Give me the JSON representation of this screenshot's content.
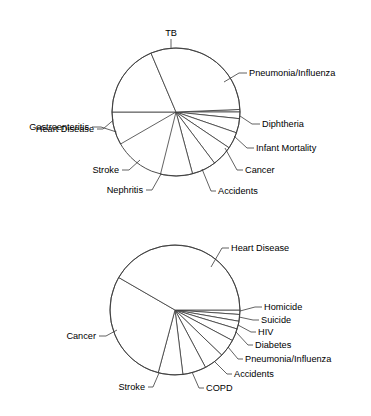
{
  "figure": {
    "background_color": "#ffffff",
    "line_color": "#3a3a3a",
    "text_color": "#000000"
  },
  "chart_data": [
    {
      "type": "pie",
      "name": "leading-causes-of-death-chart-top",
      "title": "",
      "center": [
        176,
        112
      ],
      "radius": 64,
      "start_angle_deg": 0,
      "direction": "counterclockwise",
      "grid": false,
      "legend": "none",
      "labels_position": "outside-with-leader-lines",
      "categories": [
        "Diphtheria",
        "Infant Mortality",
        "Cancer",
        "Accidents",
        "Nephritis",
        "Stroke",
        "Heart Disease",
        "Gastroenteritis",
        "TB",
        "Pneumonia/Influenza"
      ],
      "values": [
        2.3,
        4.2,
        3.7,
        4.2,
        5.2,
        6.2,
        8.0,
        8.2,
        11.3,
        11.8
      ],
      "unit": "percent of all deaths",
      "slices": [
        {
          "label": "Diphtheria",
          "start_deg": 0.0,
          "end_deg": 2.3,
          "value": 2.3
        },
        {
          "label": "Infant Mortality",
          "start_deg": 354.0,
          "end_deg": 360.0,
          "value": 4.2
        },
        {
          "label": "Cancer",
          "start_deg": 341.0,
          "end_deg": 354.0,
          "value": 3.7
        },
        {
          "label": "Accidents",
          "start_deg": 326.0,
          "end_deg": 341.0,
          "value": 4.2
        },
        {
          "label": "Nephritis",
          "start_deg": 307.0,
          "end_deg": 326.0,
          "value": 5.2
        },
        {
          "label": "Stroke",
          "start_deg": 285.0,
          "end_deg": 307.0,
          "value": 6.2
        },
        {
          "label": "Heart Disease",
          "start_deg": 256.0,
          "end_deg": 285.0,
          "value": 8.0
        },
        {
          "label": "Gastroenteritis",
          "start_deg": 180.0,
          "end_deg": 210.0,
          "value": 8.2
        },
        {
          "label": "TB",
          "start_deg": 113.0,
          "end_deg": 180.0,
          "value": 11.3
        },
        {
          "label": "Pneumonia/Influenza",
          "start_deg": 2.3,
          "end_deg": 113.0,
          "value": 11.8
        }
      ]
    },
    {
      "type": "pie",
      "name": "leading-causes-of-death-chart-bottom",
      "title": "",
      "center": [
        175,
        310
      ],
      "radius": 65,
      "start_angle_deg": 0,
      "direction": "counterclockwise",
      "grid": false,
      "legend": "none",
      "labels_position": "outside-with-leader-lines",
      "categories": [
        "Homicide",
        "Suicide",
        "HIV",
        "Diabetes",
        "Pneumonia/Influenza",
        "Accidents",
        "COPD",
        "Stroke",
        "Cancer",
        "Heart Disease"
      ],
      "values": [
        0.8,
        1.3,
        1.5,
        2.4,
        3.6,
        4.0,
        4.7,
        7.0,
        23.0,
        31.0
      ],
      "unit": "percent of all deaths",
      "slices": [
        {
          "label": "Homicide",
          "start_deg": 356.0,
          "end_deg": 360.0,
          "value": 0.8
        },
        {
          "label": "Suicide",
          "start_deg": 350.0,
          "end_deg": 356.0,
          "value": 1.3
        },
        {
          "label": "HIV",
          "start_deg": 343.0,
          "end_deg": 350.0,
          "value": 1.5
        },
        {
          "label": "Diabetes",
          "start_deg": 332.0,
          "end_deg": 343.0,
          "value": 2.4
        },
        {
          "label": "Pneumonia/Influenza",
          "start_deg": 316.0,
          "end_deg": 332.0,
          "value": 3.6
        },
        {
          "label": "Accidents",
          "start_deg": 298.0,
          "end_deg": 316.0,
          "value": 4.0
        },
        {
          "label": "COPD",
          "start_deg": 277.0,
          "end_deg": 298.0,
          "value": 4.7
        },
        {
          "label": "Stroke",
          "start_deg": 255.0,
          "end_deg": 277.0,
          "value": 7.0
        },
        {
          "label": "Cancer",
          "start_deg": 150.0,
          "end_deg": 255.0,
          "value": 23.0
        },
        {
          "label": "Heart Disease",
          "start_deg": 0.0,
          "end_deg": 150.0,
          "value": 31.0
        }
      ]
    }
  ],
  "top_chart_labels": {
    "tb": "TB",
    "gastroenteritis": "Gastroenteritis",
    "heart_disease": "Heart Disease",
    "stroke": "Stroke",
    "nephritis": "Nephritis",
    "accidents": "Accidents",
    "cancer": "Cancer",
    "infant_mortality": "Infant Mortality",
    "diphtheria": "Diphtheria",
    "pneumonia_influenza": "Pneumonia/Influenza"
  },
  "bottom_chart_labels": {
    "heart_disease": "Heart Disease",
    "homicide": "Homicide",
    "suicide": "Suicide",
    "hiv": "HIV",
    "diabetes": "Diabetes",
    "pneumonia_influenza": "Pneumonia/Influenza",
    "accidents": "Accidents",
    "copd": "COPD",
    "stroke": "Stroke",
    "cancer": "Cancer"
  }
}
